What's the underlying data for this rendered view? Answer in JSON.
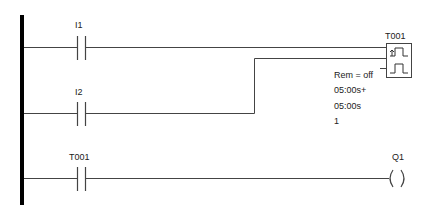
{
  "diagram": {
    "type": "ladder-logic",
    "rungs": [
      {
        "contact_label": "I1"
      },
      {
        "contact_label": "I2"
      },
      {
        "contact_label": "T001",
        "coil_label": "Q1"
      }
    ],
    "timer": {
      "name": "T001",
      "remanence": "Rem = off",
      "on_time": "05:00s+",
      "off_time": "05:00s",
      "value": "1"
    }
  }
}
